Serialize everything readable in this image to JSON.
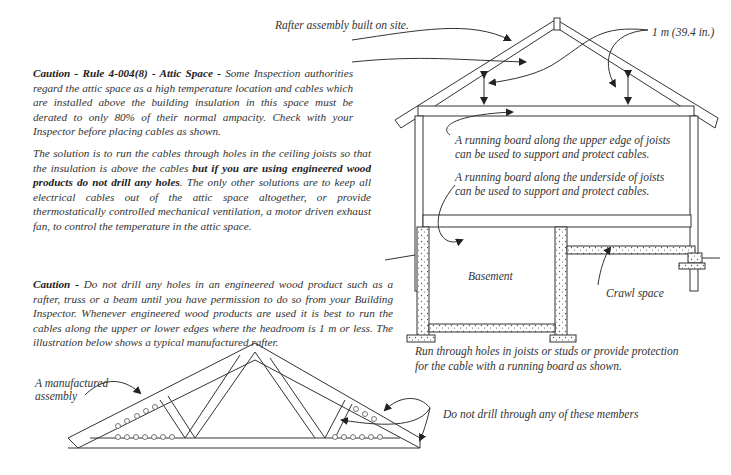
{
  "labels": {
    "rafter_site": "Rafter assembly built on site.",
    "headroom": "1 m (39.4 in.)",
    "running_board_upper_1": "A running board along the upper edge of joists",
    "running_board_upper_2": "can be used to support and protect cables.",
    "running_board_under_1": "A running board along the underside of joists",
    "running_board_under_2": "can be used to support and protect cables.",
    "basement": "Basement",
    "crawl_space": "Crawl space",
    "run_through_1": "Run through holes in joists or studs or provide protection",
    "run_through_2": "for the cable with a running board as shown.",
    "manufactured_1": "A  manufactured",
    "manufactured_2": "assembly",
    "do_not_drill": "Do not drill through any of these members"
  },
  "paragraphs": {
    "attic": {
      "bold_lead": "Caution - Rule 4-004(8) - Attic Space -",
      "body": " Some Inspection authorities regard the attic space as a high temperature location and cables which are installed above the building insulation in this space must be derated to only 80% of their normal ampacity.  Check with your Inspector before placing cables as shown."
    },
    "solution": {
      "part1": "The solution is to run the cables through holes in the ceiling joists  so that the insulation is above the cables ",
      "bold": "but if you are using engineered wood products do not drill any holes",
      "part2": ".  The only other solutions are to keep all electrical cables out of the attic space altogether, or provide thermostatically controlled mechanical ventilation, a motor driven exhaust fan, to control the temperature in the attic space."
    },
    "engineered": {
      "bold_lead": "Caution -",
      "body": " Do not drill any holes in an engineered wood product such as a rafter, truss or a beam until you have permission to do so from your Building Inspector.  Whenever engineered wood products are used it is best to run the cables along the upper or lower edges where the headroom is 1 m or less. The illustration below shows a typical manufactured rafter."
    }
  },
  "colors": {
    "ink": "#333333",
    "hatch": "#555555",
    "background": "#ffffff"
  }
}
